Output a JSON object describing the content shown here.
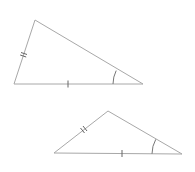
{
  "diagram": {
    "colors": {
      "background": "#ffffff",
      "side": "#a8a8a8",
      "tick": "#666666",
      "arc": "#777777"
    },
    "triangles": [
      {
        "name": "triangle-1",
        "vertices": {
          "top": [
            35,
            20
          ],
          "left": [
            14,
            84
          ],
          "right": [
            143,
            84
          ]
        },
        "marks": {
          "left_side": "double-tick",
          "base": "single-tick",
          "right_angle_marker": "single-arc"
        }
      },
      {
        "name": "triangle-2",
        "vertices": {
          "top": [
            108,
            111
          ],
          "left": [
            54,
            153
          ],
          "right": [
            182,
            154
          ]
        },
        "marks": {
          "left_side": "double-tick",
          "base": "single-tick",
          "right_angle_marker": "single-arc"
        }
      }
    ]
  }
}
